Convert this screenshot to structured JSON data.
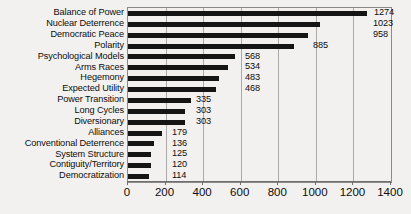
{
  "chart_data": {
    "type": "bar",
    "orientation": "horizontal",
    "title": "",
    "subtitle": "",
    "xlabel": "",
    "ylabel": "",
    "xlim": [
      0,
      1400
    ],
    "ylim": null,
    "grid": true,
    "legend": null,
    "legend_position": "none",
    "xticks": [
      "0",
      "200",
      "400",
      "600",
      "800",
      "1000",
      "1200",
      "1400"
    ],
    "xtick_values": [
      0,
      200,
      400,
      600,
      800,
      1000,
      1200,
      1400
    ],
    "categories": [
      "Balance of Power",
      "Nuclear Deterrence",
      "Democratic Peace",
      "Polarity",
      "Psychological Models",
      "Arms Races",
      "Hegemony",
      "Expected Utility",
      "Power Transition",
      "Long Cycles",
      "Diversionary",
      "Alliances",
      "Conventional Deterrence",
      "System Structure",
      "Contiguity/Territory",
      "Democratization"
    ],
    "values": [
      1274,
      1023,
      958,
      885,
      568,
      534,
      483,
      468,
      335,
      303,
      303,
      179,
      136,
      125,
      120,
      114
    ],
    "data_labels": [
      "1274",
      "1023",
      "958",
      "885",
      "568",
      "534",
      "483",
      "468",
      "335",
      "303",
      "303",
      "179",
      "136",
      "125",
      "120",
      "114"
    ],
    "bar_color": "#151515",
    "grid_color": "#a9a9a9",
    "axis_color": "#6f6f6f",
    "background_color": "#f2f1ef"
  }
}
